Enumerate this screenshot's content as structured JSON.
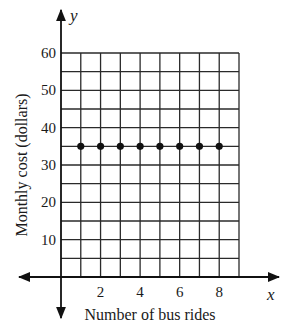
{
  "chart_data": {
    "type": "scatter",
    "title": "",
    "xlabel": "Number of bus rides",
    "ylabel": "Monthly cost (dollars)",
    "x_axis_variable": "x",
    "y_axis_variable": "y",
    "xlim": [
      0,
      9
    ],
    "ylim": [
      0,
      60
    ],
    "x_grid_step": 1,
    "y_grid_step": 5,
    "x_ticks": [
      2,
      4,
      6,
      8
    ],
    "y_ticks": [
      10,
      20,
      30,
      40,
      50,
      60
    ],
    "grid": true,
    "legend": null,
    "series": [
      {
        "name": "Monthly cost",
        "x": [
          1,
          2,
          3,
          4,
          5,
          6,
          7,
          8
        ],
        "y": [
          35,
          35,
          35,
          35,
          35,
          35,
          35,
          35
        ]
      }
    ]
  },
  "colors": {
    "ink": "#111111",
    "grid": "#2a2a2a",
    "background": "#ffffff"
  }
}
